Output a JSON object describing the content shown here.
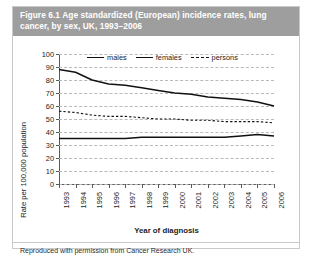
{
  "figure": {
    "caption": "Figure 6.1  Age standardized (European) incidence rates, lung cancer, by sex, UK, 1993–2006",
    "footer": "Reproduced with permission from Cancer Research UK."
  },
  "chart_data": {
    "type": "line",
    "xlabel": "Year of diagnosis",
    "ylabel": "Rate per 100,000 population",
    "categories": [
      "1993",
      "1994",
      "1995",
      "1996",
      "1997",
      "1998",
      "1999",
      "2000",
      "2001",
      "2002",
      "2003",
      "2004",
      "2005",
      "2006"
    ],
    "x": [
      1993,
      1994,
      1995,
      1996,
      1997,
      1998,
      1999,
      2000,
      2001,
      2002,
      2003,
      2004,
      2005,
      2006
    ],
    "ylim": [
      0,
      100
    ],
    "ytick_values": [
      0,
      10,
      20,
      30,
      40,
      50,
      60,
      70,
      80,
      90,
      100
    ],
    "ytick_labels": [
      "0",
      "10",
      "20",
      "30",
      "40",
      "50",
      "60",
      "70",
      "80",
      "90",
      "100"
    ],
    "grid": "horizontal-dashed",
    "legend_position": "top-inside",
    "series": [
      {
        "name": "males",
        "style": "solid",
        "color": "#111111",
        "values": [
          88,
          86,
          80,
          77,
          76,
          74,
          72,
          70,
          69,
          67,
          66,
          65,
          63,
          60
        ]
      },
      {
        "name": "females",
        "style": "solid",
        "color": "#111111",
        "values": [
          35,
          35,
          35,
          35,
          35,
          36,
          36,
          36,
          36,
          36,
          36,
          37,
          38,
          37
        ]
      },
      {
        "name": "persons",
        "style": "dashed",
        "color": "#111111",
        "values": [
          56,
          55,
          53,
          52,
          52,
          51,
          50,
          50,
          49,
          49,
          48,
          48,
          48,
          47
        ]
      }
    ]
  },
  "legend": {
    "items": [
      {
        "label": "males",
        "style": "solid"
      },
      {
        "label": "females",
        "style": "solid"
      },
      {
        "label": "persons",
        "style": "dashed"
      }
    ]
  }
}
